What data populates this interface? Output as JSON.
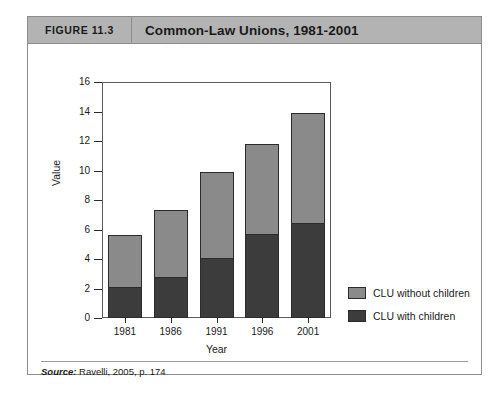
{
  "figure": {
    "number_label": "FIGURE 11.3",
    "title": "Common-Law Unions, 1981-2001",
    "source_prefix": "Source:",
    "source_text": "Ravelli, 2005, p. 174"
  },
  "colors": {
    "header_bg": "#b3b3b3",
    "frame_border": "#8d8d8d",
    "series_without_children": "#8a8a8a",
    "series_with_children": "#3c3c3c",
    "axis": "#2b2b2b",
    "page_bg": "#ffffff"
  },
  "chart_data": {
    "type": "bar",
    "stacked": true,
    "title": "Common-Law Unions, 1981-2001",
    "xlabel": "Year",
    "ylabel": "Value",
    "categories": [
      "1981",
      "1986",
      "1991",
      "1996",
      "2001"
    ],
    "ylim": [
      0,
      16
    ],
    "yticks": [
      0,
      2,
      4,
      6,
      8,
      10,
      12,
      14,
      16
    ],
    "grid": false,
    "legend_position": "right",
    "series": [
      {
        "name": "CLU with children",
        "color": "#3c3c3c",
        "values": [
          2.0,
          2.7,
          4.0,
          5.6,
          6.4
        ]
      },
      {
        "name": "CLU without children",
        "color": "#8a8a8a",
        "values": [
          3.6,
          4.6,
          5.9,
          6.2,
          7.5
        ]
      }
    ],
    "totals": [
      5.6,
      7.3,
      9.9,
      11.8,
      13.9
    ]
  }
}
